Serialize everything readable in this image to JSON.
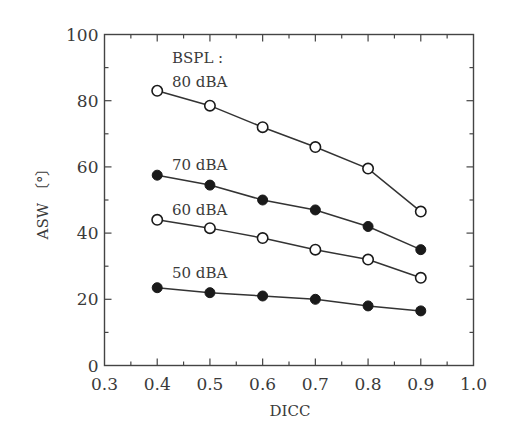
{
  "chart_data": {
    "type": "line",
    "title": "",
    "xlabel": "DICC",
    "ylabel": "ASW 〔°〕",
    "xlim": [
      0.3,
      1.0
    ],
    "ylim": [
      0,
      100
    ],
    "x_ticks": [
      "0.3",
      "0.4",
      "0.5",
      "0.6",
      "0.7",
      "0.8",
      "0.9",
      "1.0"
    ],
    "y_ticks": [
      "0",
      "20",
      "40",
      "60",
      "80",
      "100"
    ],
    "grid": false,
    "legend_title": "BSPL :",
    "x": [
      0.4,
      0.5,
      0.6,
      0.7,
      0.8,
      0.9
    ],
    "series": [
      {
        "name": "80 dBA",
        "marker": "open-circle",
        "values": [
          83,
          78.5,
          72,
          66,
          59.5,
          46.5
        ]
      },
      {
        "name": "70 dBA",
        "marker": "filled-circle",
        "values": [
          57.5,
          54.5,
          50,
          47,
          42,
          35
        ]
      },
      {
        "name": "60 dBA",
        "marker": "open-circle",
        "values": [
          44,
          41.5,
          38.5,
          35,
          32,
          26.5
        ]
      },
      {
        "name": "50 dBA",
        "marker": "filled-circle",
        "values": [
          23.5,
          22,
          21,
          20,
          18,
          16.5
        ]
      }
    ]
  }
}
